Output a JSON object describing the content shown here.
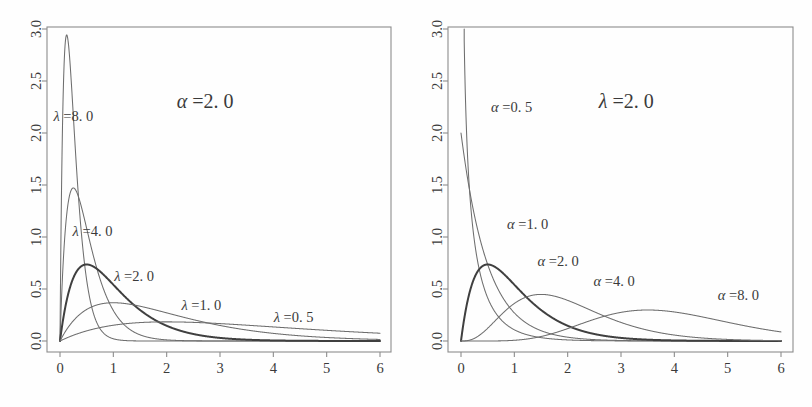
{
  "figure": {
    "width": 812,
    "height": 407,
    "background": "#ffffff",
    "axis_color": "#8c8c8c",
    "curve_color": "#6e6e6e",
    "emphasis_color": "#3f3f3f"
  },
  "chart_data": [
    {
      "type": "line",
      "panel": "left",
      "title": "α =2. 0",
      "title_x": 2.72,
      "title_y": 2.24,
      "xlabel": "",
      "ylabel": "",
      "xlim": [
        0,
        6
      ],
      "ylim": [
        0,
        3
      ],
      "xticks": [
        0,
        1,
        2,
        3,
        4,
        5,
        6
      ],
      "xtick_labels": [
        "0",
        "1",
        "2",
        "3",
        "4",
        "5",
        "6"
      ],
      "yticks": [
        0.0,
        0.5,
        1.0,
        1.5,
        2.0,
        2.5,
        3.0
      ],
      "ytick_labels": [
        "0.0",
        "0.5",
        "1.0",
        "1.5",
        "2.0",
        "2.5",
        "3.0"
      ],
      "grid": false,
      "legend": "inline-annotations",
      "distribution": "gamma",
      "fixed_parameter": {
        "name": "alpha",
        "value": 2.0
      },
      "varied_parameter": "lambda",
      "series": [
        {
          "name": "λ =8. 0",
          "lambda": 8.0,
          "alpha": 2.0,
          "emphasis": false,
          "peak_x": 0.125,
          "peak_y": 2.943,
          "label_x": 0.25,
          "label_y": 2.12
        },
        {
          "name": "λ =4. 0",
          "lambda": 4.0,
          "alpha": 2.0,
          "emphasis": false,
          "peak_x": 0.25,
          "peak_y": 1.471,
          "label_x": 0.61,
          "label_y": 1.01
        },
        {
          "name": "λ =2. 0",
          "lambda": 2.0,
          "alpha": 2.0,
          "emphasis": true,
          "peak_x": 0.5,
          "peak_y": 0.736,
          "label_x": 1.39,
          "label_y": 0.575
        },
        {
          "name": "λ =1. 0",
          "lambda": 1.0,
          "alpha": 2.0,
          "emphasis": false,
          "peak_x": 1.0,
          "peak_y": 0.368,
          "label_x": 2.65,
          "label_y": 0.295
        },
        {
          "name": "λ =0. 5",
          "lambda": 0.5,
          "alpha": 2.0,
          "emphasis": false,
          "peak_x": 2.0,
          "peak_y": 0.184,
          "label_x": 4.38,
          "label_y": 0.185
        }
      ]
    },
    {
      "type": "line",
      "panel": "right",
      "title": "λ =2. 0",
      "title_x": 3.1,
      "title_y": 2.24,
      "xlabel": "",
      "ylabel": "",
      "xlim": [
        0,
        6
      ],
      "ylim": [
        0,
        3
      ],
      "xticks": [
        0,
        1,
        2,
        3,
        4,
        5,
        6
      ],
      "xtick_labels": [
        "0",
        "1",
        "2",
        "3",
        "4",
        "5",
        "6"
      ],
      "yticks": [
        0.0,
        0.5,
        1.0,
        1.5,
        2.0,
        2.5,
        3.0
      ],
      "ytick_labels": [
        "0.0",
        "0.5",
        "1.0",
        "1.5",
        "2.0",
        "2.5",
        "3.0"
      ],
      "grid": false,
      "legend": "inline-annotations",
      "distribution": "gamma",
      "fixed_parameter": {
        "name": "lambda",
        "value": 2.0
      },
      "varied_parameter": "alpha",
      "series": [
        {
          "name": "α =0. 5",
          "alpha": 0.5,
          "lambda": 2.0,
          "emphasis": false,
          "peak_x": 0.0,
          "peak_y": 2.9,
          "label_x": 0.95,
          "label_y": 2.2
        },
        {
          "name": "α =1. 0",
          "alpha": 1.0,
          "lambda": 2.0,
          "emphasis": false,
          "peak_x": 0.0,
          "peak_y": 2.0,
          "label_x": 1.25,
          "label_y": 1.08
        },
        {
          "name": "α =2. 0",
          "alpha": 2.0,
          "lambda": 2.0,
          "emphasis": true,
          "peak_x": 0.5,
          "peak_y": 0.736,
          "label_x": 1.82,
          "label_y": 0.72
        },
        {
          "name": "α =4. 0",
          "alpha": 4.0,
          "lambda": 2.0,
          "emphasis": false,
          "peak_x": 1.5,
          "peak_y": 0.446,
          "label_x": 2.87,
          "label_y": 0.525
        },
        {
          "name": "α =8. 0",
          "alpha": 8.0,
          "lambda": 2.0,
          "emphasis": false,
          "peak_x": 3.5,
          "peak_y": 0.288,
          "label_x": 5.2,
          "label_y": 0.395
        }
      ]
    }
  ]
}
